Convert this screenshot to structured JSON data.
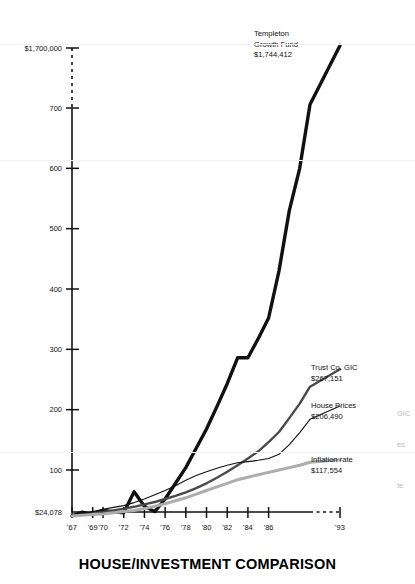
{
  "chart_data": {
    "type": "line",
    "title": "HOUSE/INVESTMENT COMPARISON",
    "xlabel": "",
    "ylabel": "",
    "grid": false,
    "legend_position": "inline-right",
    "axis_break": {
      "between": [
        "'86",
        "'93"
      ],
      "style": "dashed"
    },
    "y_axis": {
      "baseline_label": "$24,078",
      "ticks": [
        "100",
        "200",
        "300",
        "400",
        "500",
        "600",
        "700",
        "$1,700,000"
      ],
      "tick_values": [
        100,
        200,
        300,
        400,
        500,
        600,
        700,
        1700
      ],
      "note": "values in thousands of dollars; top tick is a broken/compressed scale"
    },
    "x_axis": {
      "tick_labels": [
        "'67",
        "'69",
        "'70",
        "'72",
        "'74",
        "'76",
        "'78",
        "'80",
        "'82",
        "'84",
        "'86",
        "'93"
      ]
    },
    "series": [
      {
        "name": "Templeton Growth Fund",
        "end_label": "$1,744,412",
        "end_value": 1744412,
        "color": "#111111",
        "width": 3.4,
        "values": [
          24,
          30,
          26,
          33,
          31,
          29,
          64,
          40,
          31,
          52,
          78,
          104,
          136,
          168,
          205,
          243,
          286,
          286,
          318,
          352,
          430,
          530,
          600,
          760,
          1744
        ]
      },
      {
        "name": "Trust Co. GIC",
        "end_label": "$267,151",
        "end_value": 267151,
        "color": "#4a4a4a",
        "width": 2.4,
        "values": [
          24,
          26,
          28,
          30,
          33,
          36,
          39,
          43,
          47,
          52,
          57,
          63,
          70,
          78,
          87,
          97,
          108,
          119,
          131,
          146,
          163,
          186,
          210,
          238,
          267
        ]
      },
      {
        "name": "House Prices",
        "end_label": "$206,490",
        "end_value": 206490,
        "color": "#111111",
        "width": 1.1,
        "values": [
          24,
          27,
          31,
          35,
          38,
          41,
          46,
          52,
          59,
          66,
          74,
          83,
          91,
          97,
          103,
          108,
          112,
          114,
          116,
          119,
          126,
          142,
          162,
          184,
          206
        ]
      },
      {
        "name": "Inflation rate",
        "end_label": "$117,554",
        "end_value": 117554,
        "color": "#adadad",
        "width": 3.0,
        "values": [
          24,
          25,
          26,
          27,
          29,
          31,
          33,
          36,
          40,
          44,
          49,
          54,
          60,
          66,
          72,
          78,
          84,
          88,
          92,
          96,
          100,
          104,
          108,
          113,
          117
        ]
      }
    ],
    "annotations": [
      {
        "name": "templeton-annotation",
        "lines": [
          "Templeton",
          "Growth Fund",
          "$1,744,412"
        ]
      },
      {
        "name": "gic-annotation",
        "lines": [
          "Trust Co. GIC",
          "$267,151"
        ]
      },
      {
        "name": "house-annotation",
        "lines": [
          "House Prices",
          "$206,490"
        ]
      },
      {
        "name": "inflation-annotation",
        "lines": [
          "Inflation rate",
          "$117,554"
        ]
      }
    ],
    "edge_artifacts": [
      "GIC",
      "es",
      "te"
    ]
  }
}
